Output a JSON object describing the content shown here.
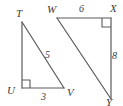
{
  "figure": {
    "stroke_color": "#5a5a5a",
    "label_color": "#3b3b3b",
    "background_color": "#ffffff",
    "triangles": [
      {
        "name": "triangle-TUV",
        "vertices": [
          {
            "id": "T",
            "label": "T",
            "x": 22,
            "y": 22
          },
          {
            "id": "U",
            "label": "U",
            "x": 22,
            "y": 88
          },
          {
            "id": "V",
            "label": "V",
            "x": 63,
            "y": 88
          }
        ],
        "right_angle_at": "U",
        "sides": [
          {
            "from": "T",
            "to": "V",
            "measure": "5"
          },
          {
            "from": "U",
            "to": "V",
            "measure": "3"
          },
          {
            "from": "T",
            "to": "U",
            "measure": ""
          }
        ]
      },
      {
        "name": "triangle-WXY",
        "vertices": [
          {
            "id": "W",
            "label": "W",
            "x": 57,
            "y": 18
          },
          {
            "id": "X",
            "label": "X",
            "x": 110,
            "y": 18
          },
          {
            "id": "Y",
            "label": "Y",
            "x": 110,
            "y": 98
          }
        ],
        "right_angle_at": "X",
        "sides": [
          {
            "from": "W",
            "to": "X",
            "measure": "6"
          },
          {
            "from": "X",
            "to": "Y",
            "measure": "8"
          },
          {
            "from": "W",
            "to": "Y",
            "measure": ""
          }
        ]
      }
    ],
    "vertex_labels": {
      "T": "T",
      "U": "U",
      "V": "V",
      "W": "W",
      "X": "X",
      "Y": "Y"
    },
    "measure_labels": {
      "TV": "5",
      "UV": "3",
      "WX": "6",
      "XY": "8"
    }
  }
}
